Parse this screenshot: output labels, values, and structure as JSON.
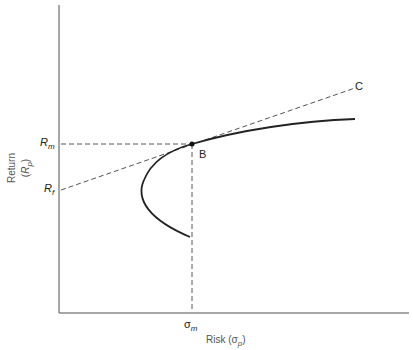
{
  "diagram": {
    "type": "capital market line / efficient frontier",
    "axes": {
      "x_label": "Risk",
      "x_label_symbol": "σ",
      "x_label_sub": "p",
      "y_label": "Return",
      "y_label_symbol": "R",
      "y_label_sub": "p"
    },
    "ticks": {
      "rm": {
        "symbol": "R",
        "sub": "m"
      },
      "rf": {
        "symbol": "R",
        "sub": "f"
      },
      "sigma_m": {
        "symbol": "σ",
        "sub": "m"
      }
    },
    "points": {
      "b": {
        "label": "B"
      },
      "c": {
        "label": "C"
      }
    },
    "colors": {
      "axis": "#8a8a8a",
      "curve": "#222222",
      "dashed": "#555555",
      "text": "#222222"
    }
  }
}
